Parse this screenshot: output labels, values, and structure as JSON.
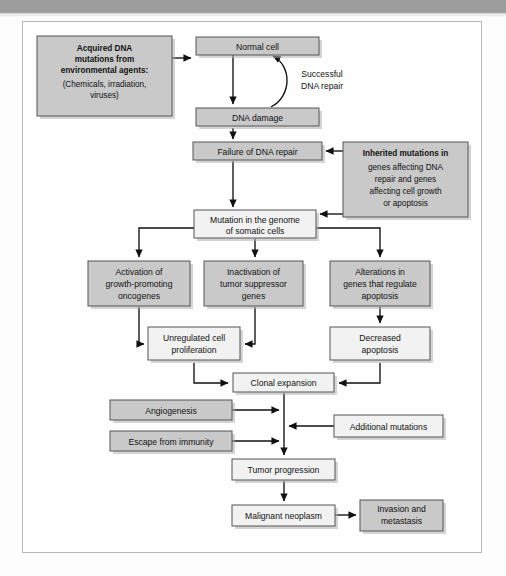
{
  "page": {
    "frame_border_color": "#b9b9b9",
    "top_bar_color": "#9d9d9d"
  },
  "style": {
    "shaded_fill": "#c9c9c9",
    "light_fill": "#f2f2f2",
    "box_stroke": "#555555",
    "arrow_color": "#111111"
  },
  "nodes": {
    "acquired_mutations": {
      "lines_bold": [
        "Acquired DNA",
        "mutations from",
        "environmental agents:"
      ],
      "lines_plain": [
        "(Chemicals, irradiation,",
        "viruses)"
      ]
    },
    "normal_cell": {
      "label": "Normal cell"
    },
    "dna_damage": {
      "label": "DNA damage"
    },
    "failure_repair": {
      "label": "Failure of DNA repair"
    },
    "inherited_mutations": {
      "lines_bold": [
        "Inherited mutations in"
      ],
      "lines_plain": [
        "genes affecting DNA",
        "repair and genes",
        "affecting cell growth",
        "or apoptosis"
      ]
    },
    "mutation_genome": {
      "lines": [
        "Mutation in the genome",
        "of somatic cells"
      ]
    },
    "activation_oncogenes": {
      "lines": [
        "Activation of",
        "growth-promoting",
        "oncogenes"
      ]
    },
    "inactivation_tumor_suppressor": {
      "lines": [
        "Inactivation of",
        "tumor suppressor",
        "genes"
      ]
    },
    "alterations_apoptosis": {
      "lines": [
        "Alterations in",
        "genes that regulate",
        "apoptosis"
      ]
    },
    "unregulated_proliferation": {
      "lines": [
        "Unregulated cell",
        "proliferation"
      ]
    },
    "decreased_apoptosis": {
      "lines": [
        "Decreased",
        "apoptosis"
      ]
    },
    "clonal_expansion": {
      "label": "Clonal expansion"
    },
    "angiogenesis": {
      "label": "Angiogenesis"
    },
    "escape_immunity": {
      "label": "Escape from immunity"
    },
    "additional_mutations": {
      "label": "Additional mutations"
    },
    "tumor_progression": {
      "label": "Tumor progression"
    },
    "malignant_neoplasm": {
      "label": "Malignant neoplasm"
    },
    "invasion_metastasis": {
      "lines": [
        "Invasion and",
        "metastasis"
      ]
    }
  },
  "edge_labels": {
    "successful_repair": {
      "lines": [
        "Successful",
        "DNA repair"
      ]
    }
  }
}
